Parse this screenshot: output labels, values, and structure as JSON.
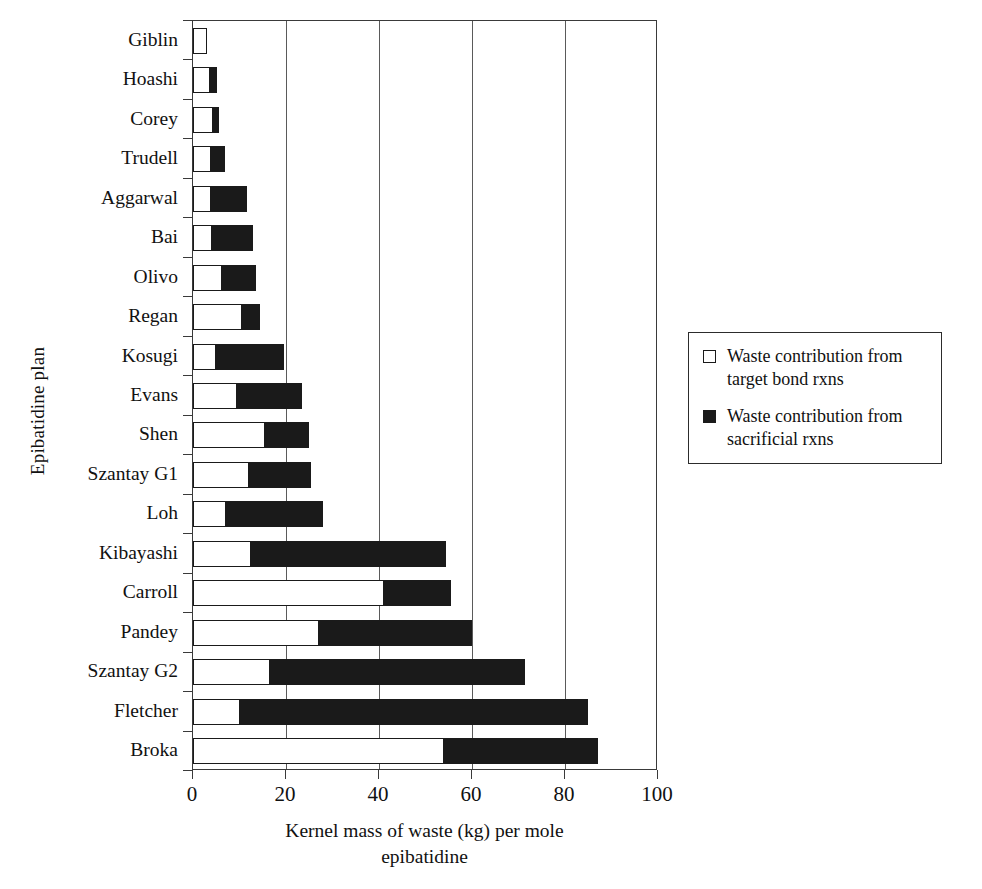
{
  "chart_data": {
    "type": "bar",
    "orientation": "horizontal",
    "stacked": true,
    "title": "",
    "xlabel": "Kernel mass of waste (kg) per mole epibatidine",
    "xlabel_line1": "Kernel mass of waste (kg) per mole",
    "xlabel_line2": "epibatidine",
    "ylabel": "Epibatidine plan",
    "xlim": [
      0,
      100
    ],
    "xticks": [
      0,
      20,
      40,
      60,
      80,
      100
    ],
    "xtick_labels": [
      "0",
      "20",
      "40",
      "60",
      "80",
      "100"
    ],
    "grid": "vertical",
    "legend_position": "right",
    "categories": [
      "Giblin",
      "Hoashi",
      "Corey",
      "Trudell",
      "Aggarwal",
      "Bai",
      "Olivo",
      "Regan",
      "Kosugi",
      "Evans",
      "Shen",
      "Szantay G1",
      "Loh",
      "Kibayashi",
      "Carroll",
      "Pandey",
      "Szantay G2",
      "Fletcher",
      "Broka"
    ],
    "series": [
      {
        "name": "Waste contribution from target bond rxns",
        "color": "#ffffff",
        "values": [
          3.0,
          3.6,
          4.2,
          3.9,
          3.8,
          4.0,
          6.3,
          10.5,
          5.0,
          9.5,
          15.5,
          12.0,
          7.0,
          12.5,
          41.0,
          27.0,
          16.5,
          10.0,
          54.0
        ]
      },
      {
        "name": "Waste contribution from sacrificial rxns",
        "color": "#1a1a1a",
        "values": [
          0.0,
          1.5,
          1.3,
          3.0,
          7.8,
          8.8,
          7.2,
          4.0,
          14.5,
          14.0,
          9.5,
          13.3,
          21.0,
          42.0,
          14.5,
          33.0,
          55.0,
          75.0,
          33.0
        ]
      }
    ],
    "totals": [
      3.0,
      5.1,
      5.5,
      6.9,
      11.6,
      12.8,
      13.5,
      14.5,
      19.5,
      23.5,
      25.0,
      25.3,
      28.0,
      54.5,
      55.5,
      60.0,
      71.5,
      85.0,
      87.0
    ]
  },
  "legend": {
    "items": [
      {
        "swatch": "white-square-icon",
        "label_line1": "Waste contribution from",
        "label_line2": "target bond rxns"
      },
      {
        "swatch": "black-square-icon",
        "label_line1": "Waste contribution from",
        "label_line2": "sacrificial rxns"
      }
    ]
  }
}
